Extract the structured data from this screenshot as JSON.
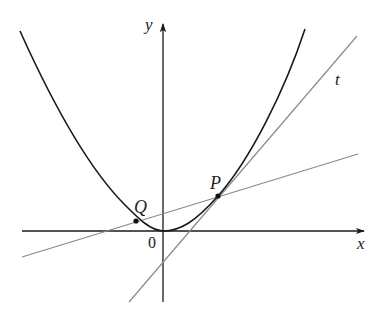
{
  "diagram": {
    "type": "geometry-figure",
    "labels": {
      "x_axis": "x",
      "y_axis": "y",
      "origin": "0",
      "point_P": "P",
      "point_Q": "Q",
      "tangent": "t"
    },
    "colors": {
      "curve": "#1a1a1a",
      "axes": "#1a1a1a",
      "lines": "#8a8a8a",
      "points": "#111111"
    },
    "elements": [
      {
        "kind": "axis",
        "name": "x-axis",
        "label": "x"
      },
      {
        "kind": "axis",
        "name": "y-axis",
        "label": "y"
      },
      {
        "kind": "curve",
        "name": "parabola"
      },
      {
        "kind": "line",
        "name": "tangent-line",
        "label": "t",
        "through": [
          "P"
        ]
      },
      {
        "kind": "line",
        "name": "secant-line",
        "through": [
          "Q",
          "P"
        ]
      },
      {
        "kind": "point",
        "name": "P",
        "label": "P"
      },
      {
        "kind": "point",
        "name": "Q",
        "label": "Q"
      }
    ]
  }
}
